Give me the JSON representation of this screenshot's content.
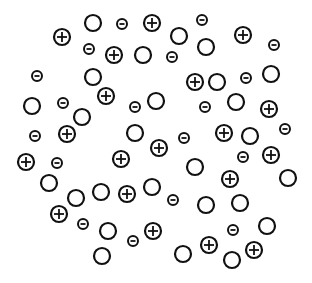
{
  "diagram": {
    "colors": {
      "stroke": "#111111",
      "background": "#ffffff"
    },
    "sizes": {
      "plus_r": 8,
      "neutral_r": 8,
      "minus_r": 5
    },
    "particles": [
      {
        "type": "plus",
        "x": 62,
        "y": 37
      },
      {
        "type": "neutral",
        "x": 93,
        "y": 23
      },
      {
        "type": "minus",
        "x": 122,
        "y": 24
      },
      {
        "type": "plus",
        "x": 152,
        "y": 23
      },
      {
        "type": "minus",
        "x": 89,
        "y": 49
      },
      {
        "type": "plus",
        "x": 114,
        "y": 55
      },
      {
        "type": "neutral",
        "x": 143,
        "y": 55
      },
      {
        "type": "minus",
        "x": 37,
        "y": 76
      },
      {
        "type": "neutral",
        "x": 93,
        "y": 77
      },
      {
        "type": "plus",
        "x": 106,
        "y": 96
      },
      {
        "type": "minus",
        "x": 202,
        "y": 20
      },
      {
        "type": "neutral",
        "x": 179,
        "y": 36
      },
      {
        "type": "neutral",
        "x": 206,
        "y": 47
      },
      {
        "type": "plus",
        "x": 243,
        "y": 35
      },
      {
        "type": "minus",
        "x": 274,
        "y": 45
      },
      {
        "type": "minus",
        "x": 172,
        "y": 57
      },
      {
        "type": "plus",
        "x": 195,
        "y": 82
      },
      {
        "type": "neutral",
        "x": 217,
        "y": 82
      },
      {
        "type": "minus",
        "x": 246,
        "y": 78
      },
      {
        "type": "neutral",
        "x": 271,
        "y": 74
      },
      {
        "type": "neutral",
        "x": 32,
        "y": 106
      },
      {
        "type": "minus",
        "x": 63,
        "y": 103
      },
      {
        "type": "neutral",
        "x": 82,
        "y": 117
      },
      {
        "type": "minus",
        "x": 135,
        "y": 107
      },
      {
        "type": "neutral",
        "x": 156,
        "y": 101
      },
      {
        "type": "minus",
        "x": 35,
        "y": 136
      },
      {
        "type": "plus",
        "x": 67,
        "y": 134
      },
      {
        "type": "neutral",
        "x": 135,
        "y": 133
      },
      {
        "type": "plus",
        "x": 26,
        "y": 162
      },
      {
        "type": "minus",
        "x": 57,
        "y": 163
      },
      {
        "type": "plus",
        "x": 121,
        "y": 159
      },
      {
        "type": "plus",
        "x": 159,
        "y": 148
      },
      {
        "type": "minus",
        "x": 205,
        "y": 107
      },
      {
        "type": "neutral",
        "x": 236,
        "y": 102
      },
      {
        "type": "plus",
        "x": 269,
        "y": 109
      },
      {
        "type": "minus",
        "x": 184,
        "y": 138
      },
      {
        "type": "plus",
        "x": 224,
        "y": 133
      },
      {
        "type": "neutral",
        "x": 250,
        "y": 136
      },
      {
        "type": "minus",
        "x": 285,
        "y": 129
      },
      {
        "type": "minus",
        "x": 243,
        "y": 157
      },
      {
        "type": "plus",
        "x": 271,
        "y": 155
      },
      {
        "type": "neutral",
        "x": 195,
        "y": 167
      },
      {
        "type": "plus",
        "x": 230,
        "y": 179
      },
      {
        "type": "neutral",
        "x": 288,
        "y": 178
      },
      {
        "type": "neutral",
        "x": 49,
        "y": 183
      },
      {
        "type": "neutral",
        "x": 76,
        "y": 198
      },
      {
        "type": "neutral",
        "x": 101,
        "y": 192
      },
      {
        "type": "plus",
        "x": 127,
        "y": 194
      },
      {
        "type": "neutral",
        "x": 152,
        "y": 187
      },
      {
        "type": "plus",
        "x": 59,
        "y": 214
      },
      {
        "type": "minus",
        "x": 83,
        "y": 224
      },
      {
        "type": "neutral",
        "x": 108,
        "y": 231
      },
      {
        "type": "minus",
        "x": 133,
        "y": 241
      },
      {
        "type": "plus",
        "x": 153,
        "y": 231
      },
      {
        "type": "neutral",
        "x": 102,
        "y": 256
      },
      {
        "type": "minus",
        "x": 173,
        "y": 200
      },
      {
        "type": "neutral",
        "x": 206,
        "y": 205
      },
      {
        "type": "neutral",
        "x": 240,
        "y": 203
      },
      {
        "type": "minus",
        "x": 233,
        "y": 230
      },
      {
        "type": "neutral",
        "x": 267,
        "y": 226
      },
      {
        "type": "plus",
        "x": 209,
        "y": 245
      },
      {
        "type": "neutral",
        "x": 183,
        "y": 254
      },
      {
        "type": "neutral",
        "x": 232,
        "y": 260
      },
      {
        "type": "plus",
        "x": 254,
        "y": 250
      }
    ]
  }
}
